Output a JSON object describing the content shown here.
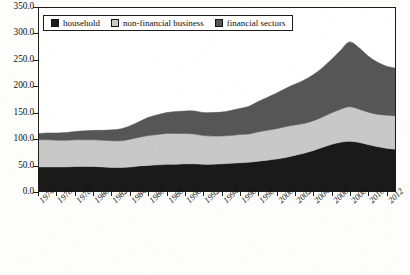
{
  "legend": {
    "items": [
      {
        "label": "household",
        "color": "#1a1a1a",
        "key": "household"
      },
      {
        "label": "non-financial business",
        "color": "#c8c8c8",
        "key": "nonfinancial"
      },
      {
        "label": "financial sectors",
        "color": "#565656",
        "key": "financial"
      }
    ]
  },
  "axes": {
    "y_ticks": [
      "0.0",
      "50.0",
      "100.0",
      "150.0",
      "200.0",
      "250.0",
      "300.0",
      "350.0"
    ],
    "x_ticks": [
      "1974",
      "1976",
      "1978",
      "1980",
      "1982",
      "1984",
      "1986",
      "1988",
      "1990",
      "1992",
      "1994",
      "1996",
      "1998",
      "2000",
      "2002",
      "2004",
      "2006",
      "2008",
      "2010",
      "2012"
    ]
  },
  "chart_data": {
    "type": "area",
    "stacked": true,
    "title": "",
    "xlabel": "",
    "ylabel": "",
    "ylim": [
      0,
      350
    ],
    "xlim": [
      1974,
      2013
    ],
    "grid": false,
    "legend_position": "top-left",
    "x": [
      1974,
      1975,
      1976,
      1977,
      1978,
      1979,
      1980,
      1981,
      1982,
      1983,
      1984,
      1985,
      1986,
      1987,
      1988,
      1989,
      1990,
      1991,
      1992,
      1993,
      1994,
      1995,
      1996,
      1997,
      1998,
      1999,
      2000,
      2001,
      2002,
      2003,
      2004,
      2005,
      2006,
      2007,
      2008,
      2009,
      2010,
      2011,
      2012,
      2013
    ],
    "series": [
      {
        "name": "household",
        "color": "#1a1a1a",
        "values": [
          46,
          46,
          46,
          46,
          47,
          47,
          47,
          46,
          45,
          45,
          46,
          48,
          49,
          50,
          51,
          51,
          52,
          52,
          51,
          51,
          52,
          53,
          54,
          55,
          57,
          59,
          61,
          64,
          68,
          72,
          77,
          83,
          89,
          93,
          95,
          93,
          89,
          85,
          82,
          80
        ]
      },
      {
        "name": "non-financial business",
        "color": "#c8c8c8",
        "values": [
          52,
          52,
          51,
          51,
          51,
          51,
          51,
          51,
          51,
          51,
          53,
          55,
          57,
          58,
          59,
          59,
          58,
          57,
          55,
          54,
          53,
          53,
          54,
          54,
          56,
          57,
          58,
          59,
          58,
          57,
          57,
          58,
          60,
          63,
          66,
          64,
          62,
          62,
          63,
          64
        ]
      },
      {
        "name": "financial sectors",
        "color": "#565656",
        "values": [
          12,
          13,
          14,
          15,
          16,
          17,
          18,
          19,
          21,
          23,
          26,
          30,
          35,
          38,
          40,
          42,
          43,
          44,
          44,
          45,
          46,
          48,
          50,
          53,
          58,
          63,
          68,
          73,
          78,
          83,
          88,
          94,
          102,
          112,
          124,
          118,
          108,
          100,
          94,
          91
        ]
      }
    ]
  }
}
